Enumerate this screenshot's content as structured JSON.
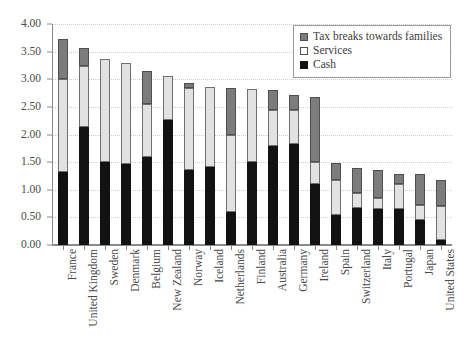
{
  "chart_data": {
    "type": "bar",
    "subtype": "stacked-vertical",
    "title": "",
    "xlabel": "",
    "ylabel": "",
    "ylim": [
      0.0,
      4.0
    ],
    "ytick_step": 0.5,
    "ytick_labels": [
      "0.00",
      "0.50",
      "1.00",
      "1.50",
      "2.00",
      "2.50",
      "3.00",
      "3.50",
      "4.00"
    ],
    "ytick_values": [
      0.0,
      0.5,
      1.0,
      1.5,
      2.0,
      2.5,
      3.0,
      3.5,
      4.0
    ],
    "grid": "horizontal-dotted",
    "legend_position": "top-right",
    "categories": [
      "France",
      "United Kingdom",
      "Sweden",
      "Denmark",
      "Belgium",
      "New Zealand",
      "Norway",
      "Iceland",
      "Netherlands",
      "Finland",
      "Australia",
      "Germany",
      "Ireland",
      "Spain",
      "Switzerland",
      "Italy",
      "Portugal",
      "Japan",
      "United States"
    ],
    "series": [
      {
        "name": "Cash",
        "color": "#121212",
        "values": [
          1.33,
          2.14,
          1.5,
          1.47,
          1.6,
          2.26,
          1.35,
          1.41,
          0.6,
          1.5,
          1.79,
          1.82,
          1.1,
          0.55,
          0.67,
          0.65,
          0.66,
          0.45,
          0.09
        ]
      },
      {
        "name": "Services",
        "color": "#e2e2e2",
        "values": [
          1.67,
          1.1,
          1.87,
          1.82,
          0.95,
          0.8,
          1.5,
          1.45,
          1.4,
          1.33,
          0.66,
          0.63,
          0.4,
          0.62,
          0.27,
          0.2,
          0.44,
          0.27,
          0.61
        ]
      },
      {
        "name": "Tax breaks towards families",
        "color": "#7c7c7c",
        "values": [
          0.72,
          0.33,
          0.0,
          0.0,
          0.6,
          0.0,
          0.08,
          0.0,
          0.85,
          0.0,
          0.36,
          0.27,
          1.18,
          0.31,
          0.46,
          0.5,
          0.18,
          0.56,
          0.48
        ]
      }
    ],
    "totals": [
      3.72,
      3.57,
      3.37,
      3.29,
      3.15,
      3.06,
      2.93,
      2.86,
      2.85,
      2.83,
      2.81,
      2.72,
      2.68,
      1.48,
      1.4,
      1.35,
      1.28,
      1.28,
      1.18
    ]
  },
  "legend": {
    "items": [
      {
        "label": "Tax breaks towards families",
        "swatch": "tax"
      },
      {
        "label": "Services",
        "swatch": "services"
      },
      {
        "label": "Cash",
        "swatch": "cash"
      }
    ]
  }
}
